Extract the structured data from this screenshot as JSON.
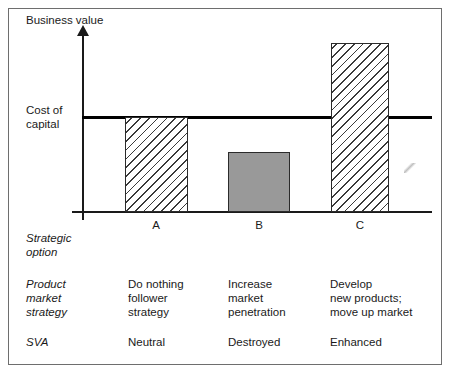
{
  "chart_data": {
    "type": "bar",
    "title": "",
    "xlabel": "",
    "ylabel": "Business value",
    "categories": [
      "A",
      "B",
      "C"
    ],
    "values": [
      95,
      60,
      169
    ],
    "value_units": "relative business value (pixel height, unlabelled axis)",
    "reference_line": {
      "label": "Cost of capital",
      "value": 95
    },
    "series": [
      {
        "name": "Business value",
        "values": [
          95,
          60,
          169
        ],
        "styles": [
          "hatched",
          "solid-grey",
          "hatched"
        ]
      }
    ],
    "grid": false,
    "legend": false,
    "annotations": [
      "Bar A top exactly meets the cost of capital line",
      "Bar B top is below the cost of capital line",
      "Bar C top is well above the cost of capital line"
    ]
  },
  "axes": {
    "y_label": "Business value",
    "cost_of_capital_line1": "Cost of",
    "cost_of_capital_line2": "capital"
  },
  "columns": {
    "letters": [
      "A",
      "B",
      "C"
    ]
  },
  "rows": {
    "strategic_option": {
      "label_line1": "Strategic",
      "label_line2": "option"
    },
    "product_market_strategy": {
      "label_line1": "Product",
      "label_line2": "market",
      "label_line3": "strategy",
      "a_line1": "Do nothing",
      "a_line2": "follower",
      "a_line3": "strategy",
      "b_line1": "Increase",
      "b_line2": "market",
      "b_line3": "penetration",
      "c_line1": "Develop",
      "c_line2": "new products;",
      "c_line3": "move up market"
    },
    "sva": {
      "label": "SVA",
      "a": "Neutral",
      "b": "Destroyed",
      "c": "Enhanced"
    }
  },
  "colors": {
    "bar_hatch_line": "#3a3a3a",
    "bar_solid_fill": "#999999",
    "bar_border": "#2b2b2b",
    "axis": "#1a1a1a",
    "cost_line": "#000000",
    "frame": "#6e6e6e",
    "background": "#ffffff"
  }
}
